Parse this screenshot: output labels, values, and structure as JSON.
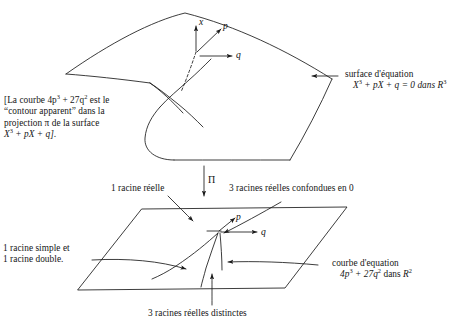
{
  "figure": {
    "background_color": "#ffffff",
    "ink_color": "#1a1a1a"
  },
  "upper_surface": {
    "axes": [
      {
        "name": "x-axis-label",
        "label": "x",
        "direction": "up"
      },
      {
        "name": "p-axis-label",
        "label": "p",
        "direction": "up-right"
      },
      {
        "name": "q-axis-label",
        "label": "q",
        "direction": "right"
      }
    ],
    "callout": {
      "line1": "surface d'équation",
      "line2_pre": "X",
      "line2_sup1": "3",
      "line2_mid": " + pX + q = 0 dans ",
      "line2_field": "R",
      "line2_sup2": "3",
      "full": "surface d'équation X3 + pX + q = 0 dans R3"
    }
  },
  "bracket_note": {
    "line1_a": "[La courbe 4p",
    "line1_sup1": "3",
    "line1_b": " + 27q",
    "line1_sup2": "2",
    "line1_c": " est le",
    "line2": "“contour apparent” dans la",
    "line3": "projection π de la surface",
    "line4_a": "X",
    "line4_sup": "3",
    "line4_b": " + pX + q].",
    "full": "[La courbe 4p3 + 27q2 est le “contour apparent” dans la projection π de la surface X3 + pX + q]."
  },
  "projection": {
    "arrow_label": "Π"
  },
  "lower_plane": {
    "axes": [
      {
        "name": "p-axis-label",
        "label": "p",
        "direction": "up-right"
      },
      {
        "name": "q-axis-label",
        "label": "q",
        "direction": "right"
      }
    ],
    "callouts": {
      "one_real_root": "1 racine réelle",
      "three_confounded": "3 racines réelles confondues en 0",
      "simple_and_double": {
        "line1": "1 racine simple et",
        "line2": "1 racine double.",
        "full": "1 racine simple et 1 racine double."
      },
      "three_distinct": "3 racines réelles distinctes",
      "curve": {
        "line1": "courbe d'equation",
        "line2_pre": "4p",
        "line2_sup1": "3",
        "line2_mid": " + 27q",
        "line2_sup2": "2",
        "line2_post": " dans ",
        "line2_field": "R",
        "line2_sup3": "2",
        "full": "courbe d'equation 4p3 + 27q2 dans R2"
      }
    }
  }
}
